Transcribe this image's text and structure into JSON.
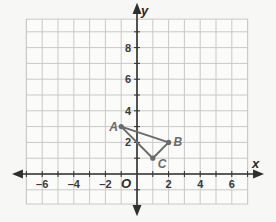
{
  "chart_data": {
    "type": "scatter",
    "title": "",
    "xlabel": "x",
    "ylabel": "y",
    "xlim": [
      -7,
      7
    ],
    "ylim": [
      -2,
      10
    ],
    "grid": true,
    "x_ticks": [
      -6,
      -4,
      -2,
      2,
      4,
      6
    ],
    "y_ticks": [
      2,
      4,
      6,
      8
    ],
    "x_tick_labels": [
      "-6",
      "-4",
      "-2",
      "2",
      "4",
      "6"
    ],
    "y_tick_labels": [
      "2",
      "4",
      "6",
      "8"
    ],
    "origin_label": "O",
    "polygon": {
      "name": "triangle ABC",
      "vertices": [
        {
          "label": "A",
          "x": -1,
          "y": 3
        },
        {
          "label": "B",
          "x": 2,
          "y": 2
        },
        {
          "label": "C",
          "x": 1,
          "y": 1
        }
      ]
    },
    "colors": {
      "grid": "#c9c9c9",
      "axis": "#2f2f2f",
      "triangle": "#6b6b6b",
      "background": "#f7f7f5"
    }
  }
}
